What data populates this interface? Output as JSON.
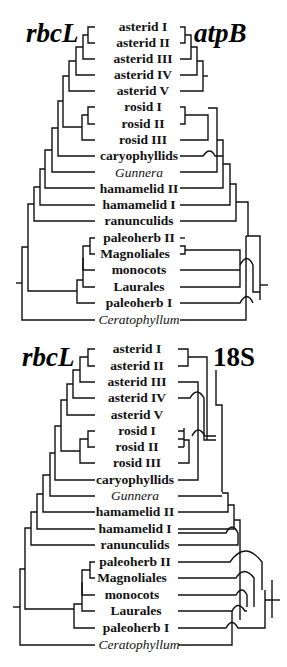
{
  "figure": {
    "panels": [
      {
        "id": "top",
        "left_gene": "rbcL",
        "right_gene": "atpB",
        "taxa": [
          "asterid I",
          "asterid II",
          "asterid III",
          "asterid IV",
          "asterid V",
          "rosid I",
          "rosid II",
          "rosid III",
          "caryophyllids",
          "Gunnera",
          "hamamelid II",
          "hamamelid I",
          "ranunculids",
          "paleoherb II",
          "Magnoliales",
          "monocots",
          "Laurales",
          "paleoherb I",
          "Ceratophyllum"
        ],
        "italic_taxa": [
          "Gunnera",
          "Ceratophyllum"
        ]
      },
      {
        "id": "bottom",
        "left_gene": "rbcL",
        "right_gene": "18S",
        "taxa": [
          "asterid I",
          "asterid II",
          "asterid III",
          "asterid IV",
          "asterid V",
          "rosid I",
          "rosid II",
          "rosid III",
          "caryophyllids",
          "Gunnera",
          "hamamelid II",
          "hamamelid I",
          "ranunculids",
          "paleoherb II",
          "Magnoliales",
          "monocots",
          "Laurales",
          "paleoherb I",
          "Ceratophyllum"
        ],
        "italic_taxa": [
          "Gunnera",
          "Ceratophyllum"
        ]
      }
    ],
    "line_color": "#111111",
    "background": "#ffffff"
  }
}
